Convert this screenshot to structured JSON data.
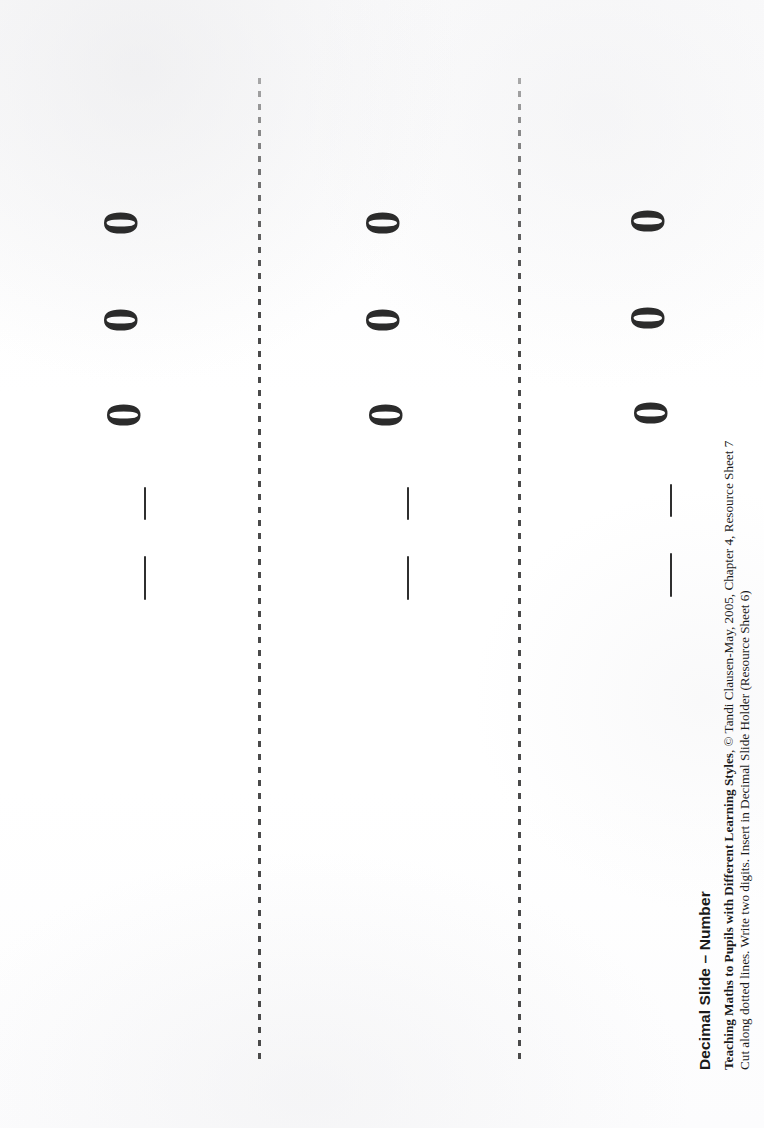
{
  "document": {
    "title": "Decimal Slide – Number",
    "background_color": "#fdfdfd",
    "ink_color": "#2b2b2b"
  },
  "caption": {
    "heading": "Decimal Slide – Number",
    "credit_bold": "Teaching Maths to Pupils with Different Learning Styles",
    "credit_rest": ", © Tandi Clausen-May, 2005, Chapter 4, Resource Sheet 7",
    "instruction": "Cut along dotted lines. Write two digits. Insert in Decimal Slide Holder (Resource Sheet 6)"
  },
  "cut_lines": [
    {
      "name": "cut-line-1",
      "x": 258,
      "top": 78,
      "height": 988,
      "style": "dotted",
      "color": "#4a4a4a"
    },
    {
      "name": "cut-line-2",
      "x": 518,
      "top": 78,
      "height": 988,
      "style": "dotted",
      "color": "#4a4a4a"
    }
  ],
  "strips": [
    {
      "id": "strip-1",
      "label": "decimal-slide-strip-1",
      "zeros": [
        {
          "value": "0",
          "x": 100,
          "y": 203
        },
        {
          "value": "0",
          "x": 100,
          "y": 300
        },
        {
          "value": "0",
          "x": 103,
          "y": 395
        }
      ],
      "dashes": [
        {
          "x": 144,
          "y": 487,
          "length": 33
        },
        {
          "x": 144,
          "y": 556,
          "length": 44
        }
      ]
    },
    {
      "id": "strip-2",
      "label": "decimal-slide-strip-2",
      "zeros": [
        {
          "value": "0",
          "x": 362,
          "y": 203
        },
        {
          "value": "0",
          "x": 362,
          "y": 300
        },
        {
          "value": "0",
          "x": 365,
          "y": 395
        }
      ],
      "dashes": [
        {
          "x": 407,
          "y": 487,
          "length": 33
        },
        {
          "x": 407,
          "y": 556,
          "length": 44
        }
      ]
    },
    {
      "id": "strip-3",
      "label": "decimal-slide-strip-3",
      "zeros": [
        {
          "value": "0",
          "x": 627,
          "y": 201
        },
        {
          "value": "0",
          "x": 627,
          "y": 298
        },
        {
          "value": "0",
          "x": 630,
          "y": 393
        }
      ],
      "dashes": [
        {
          "x": 670,
          "y": 484,
          "length": 33
        },
        {
          "x": 670,
          "y": 553,
          "length": 44
        }
      ]
    }
  ]
}
